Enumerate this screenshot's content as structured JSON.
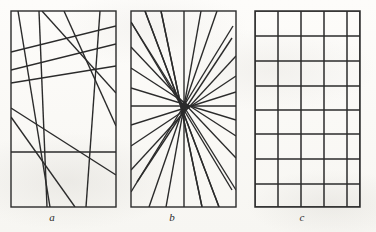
{
  "figure": {
    "background_color": "#fdfcfa",
    "ink_color": "#2b2b2b",
    "width": 376,
    "height": 232
  },
  "panels": [
    {
      "id": "panel-a",
      "caption": "a",
      "caption_x": 52,
      "caption_y": 212,
      "kind": "random-lines",
      "frame": {
        "x": 11,
        "y": 11,
        "width": 105,
        "height": 196
      },
      "stroke_width": 1.4,
      "lines": [
        {
          "x1": 11,
          "y1": 52,
          "x2": 116,
          "y2": 26
        },
        {
          "x1": 11,
          "y1": 70,
          "x2": 116,
          "y2": 44
        },
        {
          "x1": 11,
          "y1": 83,
          "x2": 116,
          "y2": 66
        },
        {
          "x1": 11,
          "y1": 152,
          "x2": 116,
          "y2": 152
        },
        {
          "x1": 11,
          "y1": 108,
          "x2": 116,
          "y2": 175
        },
        {
          "x1": 11,
          "y1": 117,
          "x2": 75,
          "y2": 207
        },
        {
          "x1": 18,
          "y1": 11,
          "x2": 50,
          "y2": 207
        },
        {
          "x1": 39,
          "y1": 11,
          "x2": 47,
          "y2": 207
        },
        {
          "x1": 64,
          "y1": 11,
          "x2": 116,
          "y2": 126
        },
        {
          "x1": 100,
          "y1": 11,
          "x2": 86,
          "y2": 207
        },
        {
          "x1": 42,
          "y1": 11,
          "x2": 116,
          "y2": 93
        }
      ]
    },
    {
      "id": "panel-b",
      "caption": "b",
      "caption_x": 172,
      "caption_y": 212,
      "kind": "concurrent-pencil",
      "frame": {
        "x": 131,
        "y": 11,
        "width": 105,
        "height": 196
      },
      "stroke_width": 1.4,
      "center": {
        "x": 184,
        "y": 106
      },
      "spoke_count": 18,
      "spokes_note": "18 rays from the common point, including one full vertical through the center",
      "spokes": [
        {
          "x1": 184,
          "y1": 11,
          "x2": 184,
          "y2": 207
        },
        {
          "x1": 161,
          "y1": 11,
          "x2": 202,
          "y2": 207
        },
        {
          "x1": 145,
          "y1": 11,
          "x2": 219,
          "y2": 207
        },
        {
          "x1": 131,
          "y1": 22,
          "x2": 232,
          "y2": 190
        },
        {
          "x1": 131,
          "y1": 47,
          "x2": 236,
          "y2": 158
        },
        {
          "x1": 131,
          "y1": 68,
          "x2": 236,
          "y2": 136
        },
        {
          "x1": 131,
          "y1": 88,
          "x2": 236,
          "y2": 120
        },
        {
          "x1": 131,
          "y1": 106,
          "x2": 236,
          "y2": 106
        },
        {
          "x1": 131,
          "y1": 125,
          "x2": 236,
          "y2": 92
        },
        {
          "x1": 131,
          "y1": 146,
          "x2": 236,
          "y2": 76
        },
        {
          "x1": 131,
          "y1": 170,
          "x2": 236,
          "y2": 56
        },
        {
          "x1": 131,
          "y1": 192,
          "x2": 233,
          "y2": 26
        },
        {
          "x1": 149,
          "y1": 207,
          "x2": 217,
          "y2": 11
        },
        {
          "x1": 166,
          "y1": 207,
          "x2": 201,
          "y2": 11
        },
        {
          "x1": 236,
          "y1": 190,
          "x2": 131,
          "y2": 22
        },
        {
          "x1": 219,
          "y1": 207,
          "x2": 145,
          "y2": 11
        },
        {
          "x1": 202,
          "y1": 207,
          "x2": 161,
          "y2": 11
        },
        {
          "x1": 232,
          "y1": 38,
          "x2": 137,
          "y2": 182
        }
      ]
    },
    {
      "id": "panel-c",
      "caption": "c",
      "caption_x": 302,
      "caption_y": 212,
      "kind": "orthogonal-grid",
      "frame": {
        "x": 255,
        "y": 11,
        "width": 105,
        "height": 196
      },
      "stroke_width": 1.5,
      "column_count": 5,
      "row_count": 8,
      "vertical_x": [
        255,
        278,
        301,
        324,
        347,
        360
      ],
      "horizontal_y": [
        11,
        36,
        61,
        86,
        110,
        134,
        159,
        184,
        207
      ]
    }
  ]
}
